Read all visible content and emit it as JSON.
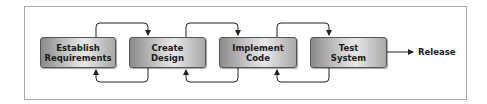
{
  "diagram": {
    "type": "waterfall-process",
    "stages": [
      {
        "line1": "Establish",
        "line2": "Requirements"
      },
      {
        "line1": "Create",
        "line2": "Design"
      },
      {
        "line1": "Implement",
        "line2": "Code"
      },
      {
        "line1": "Test",
        "line2": "System"
      }
    ],
    "output_label": "Release",
    "colors": {
      "frame": "#a9a9a9",
      "box_border": "#555555",
      "arrow": "#222222",
      "text": "#1a1a1a"
    }
  }
}
